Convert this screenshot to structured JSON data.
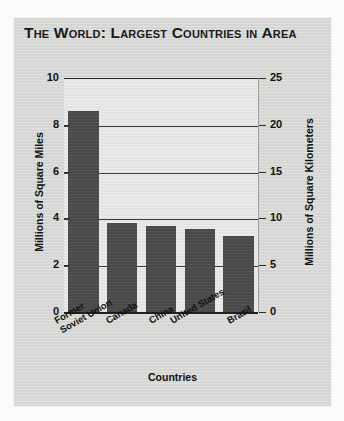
{
  "title": "The World: Largest Countries in Area",
  "chart_data": {
    "type": "bar",
    "title": "The World: Largest Countries in Area",
    "categories": [
      "Former Soviet Union",
      "Canada",
      "China",
      "United States",
      "Brazil"
    ],
    "category_lines": [
      [
        "Former",
        "Soviet Union"
      ],
      [
        "Canada"
      ],
      [
        "China"
      ],
      [
        "United States"
      ],
      [
        "Brazil"
      ]
    ],
    "values": [
      8.65,
      3.85,
      3.7,
      3.6,
      3.3
    ],
    "values_km2": [
      22.4,
      9.97,
      9.58,
      9.32,
      8.55
    ],
    "xlabel": "Countries",
    "ylabel": "Millions of Square Miles",
    "ylabel_right": "Millions of Square Kilometers",
    "ylim": [
      0,
      10
    ],
    "ylim_right": [
      0,
      25
    ],
    "yticks": [
      "0",
      "2",
      "4",
      "6",
      "8",
      "10"
    ],
    "ytick_values": [
      0,
      2,
      4,
      6,
      8,
      10
    ],
    "yticks_right": [
      "0",
      "5",
      "10",
      "15",
      "20",
      "25"
    ],
    "ytick_values_right": [
      0,
      5,
      10,
      15,
      20,
      25
    ],
    "grid": true,
    "legend": "none",
    "bar_color": "#4d4d4d",
    "plot_background": "#e7e7e5",
    "card_background": "#d9d9d7"
  }
}
